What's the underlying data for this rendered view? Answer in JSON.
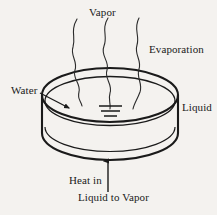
{
  "figure": {
    "background_color": "#f4f2ef",
    "ink_color": "#1a1a1a"
  },
  "labels": {
    "vapor": "Vapor",
    "evaporation": "Evaporation",
    "water": "Water",
    "liquid": "Liquid",
    "heat_in": "Heat in",
    "liquid_to_vapor": "Liquid to Vapor"
  },
  "shapes": {
    "dish": {
      "name": "open-dish-container",
      "top_rim_ellipse": {
        "cx": 110,
        "cy": 95,
        "rx": 68,
        "ry": 27
      },
      "inner_rim_ellipse": {
        "cx": 110,
        "cy": 100,
        "rx": 66,
        "ry": 25
      },
      "wall_left_x": 42,
      "wall_right_x": 178,
      "bottom_y": 160
    },
    "vapor_streams": 3,
    "liquid_level_marks": 3,
    "heat_arrow": {
      "x": 108,
      "from_y": 192,
      "to_y": 159,
      "direction": "up"
    },
    "water_pointer": {
      "from_x": 43,
      "from_y": 95,
      "to_x": 71,
      "to_y": 109,
      "direction": "down-right"
    }
  }
}
